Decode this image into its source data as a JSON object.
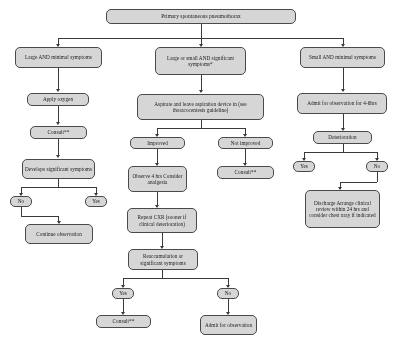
{
  "diagram": {
    "title": "Primary spontaneous pneumothorax",
    "nodes": {
      "root": "Primary spontaneous pneumothorax",
      "branch_left": "Large AND minimal symptoms",
      "branch_mid": "Large or small AND significant symptoms*",
      "branch_right": "Small AND minimal symptoms",
      "left_oxygen": "Apply oxygen",
      "left_consult": "Consult**",
      "left_develops": "Develops significant symptoms",
      "left_no": "No",
      "left_yes": "Yes",
      "left_continue": "Continue observation",
      "mid_aspirate": "Aspirate and leave aspiration device in (see thoracocentesis guideline)",
      "mid_improved": "Improved",
      "mid_not_improved": "Not improved",
      "mid_observe": "Observe 4 hrs Consider analgesia",
      "mid_consult": "Consult**",
      "mid_repeat_cxr": "Repeat CXR (sooner if clinical deterioration)",
      "mid_reaccum": "Reaccumulation or significant symptoms",
      "mid_yes": "Yes",
      "mid_no": "No",
      "mid_consult2": "Consult**",
      "mid_admit": "Admit for observation",
      "right_admit": "Admit for observation for 4-6hrs",
      "right_deterioration": "Deterioration",
      "right_yes": "Yes",
      "right_no": "No",
      "right_discharge": "Discharge Arrange clinical review within 24 hrs and consider chest xray if indicated"
    }
  }
}
